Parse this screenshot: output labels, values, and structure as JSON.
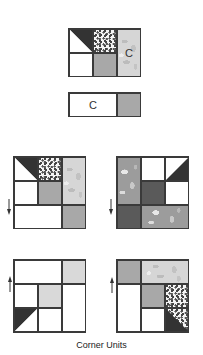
{
  "caption": "Corner Units",
  "labels": {
    "c": "C"
  },
  "diagrams": [
    {
      "name": "top-unit",
      "arrow": "left"
    },
    {
      "name": "c-strip",
      "arrow": "right"
    },
    {
      "name": "middle-left-corner",
      "arrow": "down"
    },
    {
      "name": "middle-right-corner",
      "arrow": "down"
    },
    {
      "name": "bottom-left-corner",
      "arrow": "up"
    },
    {
      "name": "bottom-right-corner",
      "arrow": "up"
    }
  ],
  "colors": {
    "outline": "#3a3a3a",
    "dark": "#333333",
    "gray": "#a8a8a8",
    "light_gray": "#d9d9d9",
    "white": "#ffffff"
  }
}
